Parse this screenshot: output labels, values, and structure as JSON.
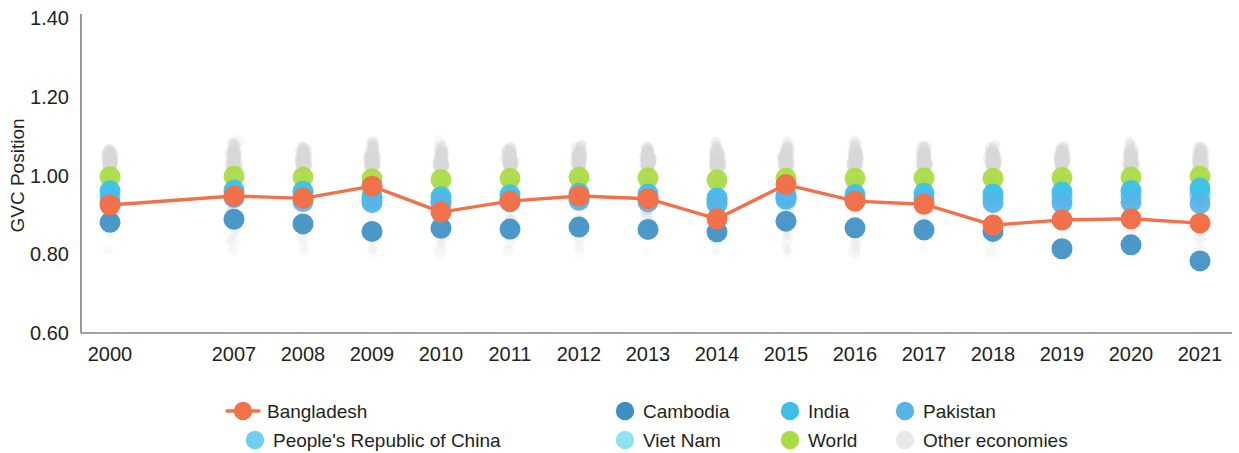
{
  "chart_data": {
    "type": "scatter",
    "title": "",
    "xlabel": "",
    "ylabel": "GVC Position",
    "x": [
      "2000",
      "2007",
      "2008",
      "2009",
      "2010",
      "2011",
      "2012",
      "2013",
      "2014",
      "2015",
      "2016",
      "2017",
      "2018",
      "2019",
      "2020",
      "2021"
    ],
    "ylim": [
      0.6,
      1.4
    ],
    "yticks": [
      "0.60",
      "0.80",
      "1.00",
      "1.20",
      "1.40"
    ],
    "ytick_values": [
      0.6,
      0.8,
      1.0,
      1.2,
      1.4
    ],
    "grid": false,
    "legend_position": "bottom",
    "series": [
      {
        "name": "Bangladesh",
        "kind": "line-marker",
        "color": "#f1714a",
        "values": [
          0.925,
          0.948,
          0.942,
          0.973,
          0.907,
          0.935,
          0.948,
          0.941,
          0.89,
          0.977,
          0.935,
          0.927,
          0.874,
          0.887,
          0.89,
          0.879
        ]
      },
      {
        "name": "Cambodia",
        "kind": "marker",
        "color": "#3d8fc4",
        "values": [
          0.881,
          0.889,
          0.877,
          0.858,
          0.866,
          0.864,
          0.869,
          0.863,
          0.857,
          0.884,
          0.867,
          0.862,
          0.858,
          0.814,
          0.824,
          0.783
        ]
      },
      {
        "name": "India",
        "kind": "marker",
        "color": "#3dbfe8",
        "values": [
          0.961,
          0.963,
          0.96,
          0.948,
          0.946,
          0.951,
          0.955,
          0.953,
          0.943,
          0.949,
          0.952,
          0.955,
          0.953,
          0.958,
          0.962,
          0.968
        ]
      },
      {
        "name": "Pakistan",
        "kind": "marker",
        "color": "#57b3e8",
        "values": [
          0.932,
          0.944,
          0.934,
          0.931,
          0.929,
          0.933,
          0.937,
          0.933,
          0.928,
          0.941,
          0.937,
          0.935,
          0.931,
          0.93,
          0.932,
          0.929
        ]
      },
      {
        "name": "People's Republic of China",
        "kind": "marker",
        "color": "#6ecff0",
        "values": [
          0.945,
          0.95,
          0.944,
          0.942,
          0.937,
          0.94,
          0.943,
          0.942,
          0.936,
          0.944,
          0.944,
          0.943,
          0.941,
          0.943,
          0.946,
          0.949
        ]
      },
      {
        "name": "Viet Nam",
        "kind": "marker",
        "color": "#8fe3f0",
        "values": [
          0.951,
          0.957,
          0.951,
          0.937,
          0.932,
          0.936,
          0.94,
          0.938,
          0.931,
          0.937,
          0.94,
          0.942,
          0.944,
          0.949,
          0.951,
          0.956
        ]
      },
      {
        "name": "World",
        "kind": "marker",
        "color": "#a8dc42",
        "values": [
          0.997,
          0.998,
          0.996,
          0.992,
          0.99,
          0.993,
          0.996,
          0.994,
          0.989,
          0.993,
          0.993,
          0.994,
          0.993,
          0.995,
          0.996,
          0.998
        ]
      },
      {
        "name": "Other economies",
        "kind": "cloud",
        "color": "#d9d9d9",
        "note": "Semi-transparent light grey scatter cloud, one vertical swarm per year, spanning roughly 0.74 to 1.22"
      }
    ]
  },
  "legend": {
    "items": [
      {
        "label": "Bangladesh",
        "color": "#f1714a",
        "marker": "line-dot"
      },
      {
        "label": "Cambodia",
        "color": "#3d8fc4",
        "marker": "dot"
      },
      {
        "label": "India",
        "color": "#3dbfe8",
        "marker": "dot"
      },
      {
        "label": "Pakistan",
        "color": "#57b3e8",
        "marker": "dot"
      },
      {
        "label": "People's Republic of China",
        "color": "#6ecff0",
        "marker": "dot"
      },
      {
        "label": "Viet Nam",
        "color": "#8fe3f0",
        "marker": "dot"
      },
      {
        "label": "World",
        "color": "#a8dc42",
        "marker": "dot"
      },
      {
        "label": "Other economies",
        "color": "#e8e8e8",
        "marker": "dot"
      }
    ]
  },
  "axes": {
    "y_title": "GVC Position",
    "axis_color": "#808080"
  }
}
